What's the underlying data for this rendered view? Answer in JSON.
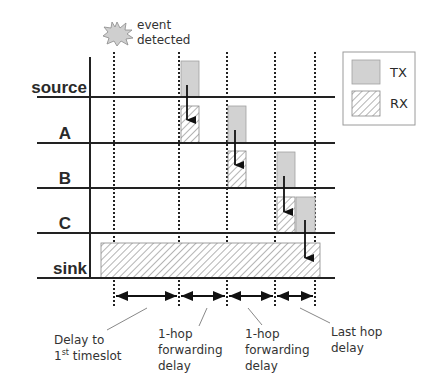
{
  "event": {
    "line1": "event",
    "line2": "detected",
    "icon": "starburst-icon"
  },
  "rows": [
    {
      "label": "source",
      "baseline_y": 97
    },
    {
      "label": "A",
      "baseline_y": 143
    },
    {
      "label": "B",
      "baseline_y": 188
    },
    {
      "label": "C",
      "baseline_y": 233
    },
    {
      "label": "sink",
      "baseline_y": 278
    }
  ],
  "timeslots_x": [
    114,
    179,
    227,
    275,
    315
  ],
  "blocks": [
    {
      "row": "source",
      "type": "TX"
    },
    {
      "row": "A",
      "type": "RX"
    },
    {
      "row": "A",
      "type": "TX"
    },
    {
      "row": "B",
      "type": "RX"
    },
    {
      "row": "B",
      "type": "TX"
    },
    {
      "row": "C",
      "type": "RX"
    },
    {
      "row": "C",
      "type": "TX"
    },
    {
      "row": "sink",
      "type": "RX"
    }
  ],
  "legend": {
    "tx_label": "TX",
    "rx_label": "RX"
  },
  "colors": {
    "tx_fill": "#d2d2d2",
    "rx_hatch": "#6a6a6a",
    "line": "#222222",
    "legend_border": "#9a9a9a"
  },
  "annotations": {
    "delay_first": {
      "line1": "Delay to",
      "line2_main": "1",
      "line2_sup": "st",
      "line2_rest": " timeslot"
    },
    "hop1": {
      "line1": "1-hop",
      "line2": "forwarding",
      "line3": "delay"
    },
    "hop2": {
      "line1": "1-hop",
      "line2": "forwarding",
      "line3": "delay"
    },
    "last_hop": {
      "line1": "Last hop",
      "line2": "delay"
    }
  }
}
